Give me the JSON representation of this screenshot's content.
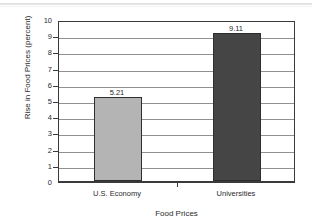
{
  "chart_data": {
    "type": "bar",
    "title": "",
    "subtitle": "",
    "xlabel": "Food Prices",
    "ylabel": "Rise in Food Prices (percent)",
    "categories": [
      "U.S. Economy",
      "Universities"
    ],
    "values": [
      5.21,
      9.11
    ],
    "value_labels": [
      "5.21",
      "9.11"
    ],
    "ylim": [
      0,
      10
    ],
    "ytick_labels": [
      "10",
      "9",
      "8",
      "7",
      "6",
      "5",
      "4",
      "3",
      "2",
      "1",
      "0"
    ],
    "ytick_values": [
      10,
      9,
      8,
      7,
      6,
      5,
      4,
      3,
      2,
      1,
      0
    ],
    "grid": true,
    "legend": "none",
    "bar_colors": [
      "#b4b4b4",
      "#454545"
    ],
    "bar_edge_color": "#2e2e2e",
    "axis_color": "#3a3a3a",
    "gridline_color": "#8f8f8f",
    "background": "#ffffff"
  }
}
